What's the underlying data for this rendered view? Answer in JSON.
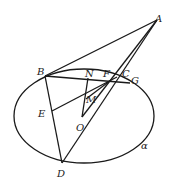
{
  "diagram": {
    "type": "geometry",
    "points": {
      "A": {
        "label": "A",
        "x": 157,
        "y": 20
      },
      "B": {
        "label": "B",
        "x": 45,
        "y": 76
      },
      "N": {
        "label": "N",
        "x": 88,
        "y": 78
      },
      "F": {
        "label": "F",
        "x": 111,
        "y": 78
      },
      "C": {
        "label": "C",
        "x": 117,
        "y": 77
      },
      "G": {
        "label": "G",
        "x": 130,
        "y": 83
      },
      "M": {
        "label": "M",
        "x": 89,
        "y": 96
      },
      "E": {
        "label": "E",
        "x": 52,
        "y": 111
      },
      "O": {
        "label": "O",
        "x": 82,
        "y": 117
      },
      "D": {
        "label": "D",
        "x": 62,
        "y": 163
      }
    },
    "plane_label": "α"
  }
}
